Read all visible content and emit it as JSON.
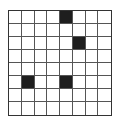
{
  "grid": {
    "rows": 8,
    "cols": 8,
    "filled_color": "#1e1e1e",
    "empty_color": "#ffffff",
    "line_color": "#555555",
    "filled_cells": [
      {
        "row": 0,
        "col": 4
      },
      {
        "row": 2,
        "col": 5
      },
      {
        "row": 5,
        "col": 1
      },
      {
        "row": 5,
        "col": 4
      }
    ]
  }
}
